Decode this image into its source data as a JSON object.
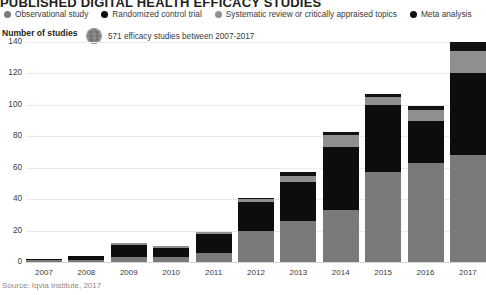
{
  "title": "PUBLISHED DIGITAL HEALTH EFFICACY STUDIES",
  "legend": {
    "items": [
      {
        "label": "Observational study",
        "color": "#7a7a7a",
        "icon": "legend-dot-icon"
      },
      {
        "label": "Randomized control trial",
        "color": "#0d0d0d",
        "icon": "legend-dot-icon"
      },
      {
        "label": "Systematic review or critically appraised topics",
        "color": "#8f8f8f",
        "icon": "legend-dot-icon"
      },
      {
        "label": "Meta analysis",
        "color": "#111111",
        "icon": "legend-dot-icon"
      }
    ]
  },
  "axis_title": "Number of studies",
  "note": {
    "icon": "globe-icon",
    "text": "571 efficacy studies between 2007-2017"
  },
  "source": "Source: Iqvia Institute, 2017",
  "chart_data": {
    "type": "bar",
    "title": "PUBLISHED DIGITAL HEALTH EFFICACY STUDIES",
    "subtitle": "571 efficacy studies between 2007-2017",
    "xlabel": "",
    "ylabel": "Number of studies",
    "ylim": [
      0,
      140
    ],
    "yticks": [
      0,
      20,
      40,
      60,
      80,
      100,
      120,
      140
    ],
    "grid": true,
    "legend_position": "top",
    "stacked": true,
    "categories": [
      "2007",
      "2008",
      "2009",
      "2010",
      "2011",
      "2012",
      "2013",
      "2014",
      "2015",
      "2016",
      "2017"
    ],
    "series": [
      {
        "name": "Observational study",
        "color": "#7a7a7a",
        "values": [
          1,
          1,
          3,
          3,
          6,
          20,
          26,
          33,
          57,
          63,
          68
        ]
      },
      {
        "name": "Randomized control trial",
        "color": "#0d0d0d",
        "values": [
          1,
          3,
          8,
          6,
          12,
          18,
          25,
          40,
          43,
          27,
          52
        ]
      },
      {
        "name": "Systematic review or critically appraised topics",
        "color": "#8f8f8f",
        "values": [
          0,
          0,
          1,
          1,
          1,
          2,
          4,
          8,
          5,
          7,
          14
        ]
      },
      {
        "name": "Meta analysis",
        "color": "#111111",
        "values": [
          0,
          0,
          0,
          0,
          0,
          1,
          2,
          2,
          2,
          2,
          6
        ]
      }
    ],
    "totals": [
      2,
      4,
      12,
      10,
      19,
      41,
      57,
      83,
      107,
      99,
      140
    ]
  }
}
